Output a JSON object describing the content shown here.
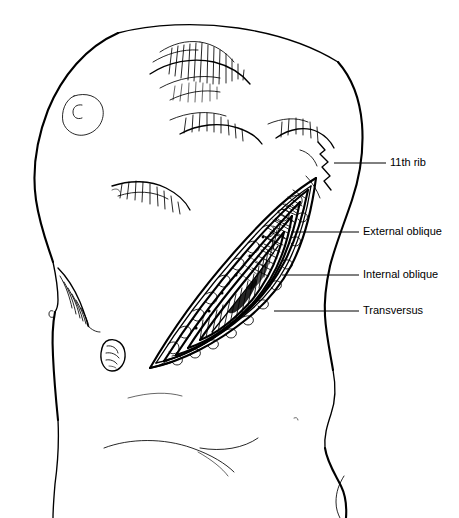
{
  "figure": {
    "background_color": "#ffffff",
    "ink_color": "#000000",
    "width": 459,
    "height": 518
  },
  "labels": [
    {
      "id": "rib-11",
      "text": "11th rib",
      "text_x": 390,
      "text_y": 163,
      "leader_x1": 334,
      "leader_x2": 386,
      "leader_y": 163
    },
    {
      "id": "external-oblique",
      "text": "External oblique",
      "text_x": 363,
      "text_y": 232,
      "leader_x1": 291,
      "leader_x2": 359,
      "leader_y": 232
    },
    {
      "id": "internal-oblique",
      "text": "Internal oblique",
      "text_x": 363,
      "text_y": 275,
      "leader_x1": 282,
      "leader_x2": 359,
      "leader_y": 275
    },
    {
      "id": "transversus",
      "text": "Transversus",
      "text_x": 363,
      "text_y": 311,
      "leader_x1": 274,
      "leader_x2": 359,
      "leader_y": 311
    }
  ],
  "anatomy_parts": [
    {
      "id": "torso-left-contour",
      "name": "left torso contour"
    },
    {
      "id": "torso-right-contour",
      "name": "right flank contour"
    },
    {
      "id": "breast-areola",
      "name": "areola"
    },
    {
      "id": "rib-cage-hatching",
      "name": "rib cage with intercostal hatching"
    },
    {
      "id": "costal-margin",
      "name": "costal margin shading"
    },
    {
      "id": "umbilicus",
      "name": "umbilicus"
    },
    {
      "id": "inguinal-creases",
      "name": "inguinal creases"
    },
    {
      "id": "incision-wound",
      "name": "open surgical incision"
    },
    {
      "id": "muscle-layers",
      "name": "nested abdominal muscle layers"
    }
  ]
}
